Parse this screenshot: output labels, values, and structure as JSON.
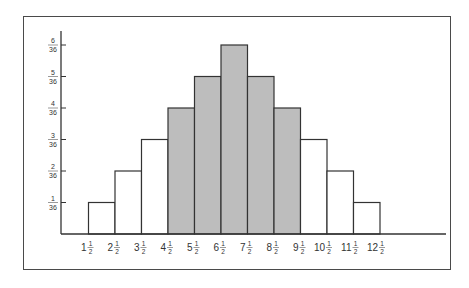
{
  "chart_data": {
    "type": "bar",
    "title": "",
    "xlabel": "",
    "ylabel": "",
    "categories": [
      "1 1/2",
      "2 1/2",
      "3 1/2",
      "4 1/2",
      "5 1/2",
      "6 1/2",
      "7 1/2",
      "8 1/2",
      "9 1/2",
      "10 1/2",
      "11 1/2",
      "12 1/2"
    ],
    "x_tick_labels": [
      {
        "whole": "1",
        "num": "1",
        "den": "2"
      },
      {
        "whole": "2",
        "num": "1",
        "den": "2"
      },
      {
        "whole": "3",
        "num": "1",
        "den": "2"
      },
      {
        "whole": "4",
        "num": "1",
        "den": "2"
      },
      {
        "whole": "5",
        "num": "1",
        "den": "2"
      },
      {
        "whole": "6",
        "num": "1",
        "den": "2"
      },
      {
        "whole": "7",
        "num": "1",
        "den": "2"
      },
      {
        "whole": "8",
        "num": "1",
        "den": "2"
      },
      {
        "whole": "9",
        "num": "1",
        "den": "2"
      },
      {
        "whole": "10",
        "num": "1",
        "den": "2"
      },
      {
        "whole": "11",
        "num": "1",
        "den": "2"
      },
      {
        "whole": "12",
        "num": "1",
        "den": "2"
      }
    ],
    "bar_bins": [
      {
        "left": "1 1/2",
        "right": "2 1/2",
        "value_numerator": 1,
        "shaded": false
      },
      {
        "left": "2 1/2",
        "right": "3 1/2",
        "value_numerator": 2,
        "shaded": false
      },
      {
        "left": "3 1/2",
        "right": "4 1/2",
        "value_numerator": 3,
        "shaded": false
      },
      {
        "left": "4 1/2",
        "right": "5 1/2",
        "value_numerator": 4,
        "shaded": true
      },
      {
        "left": "5 1/2",
        "right": "6 1/2",
        "value_numerator": 5,
        "shaded": true
      },
      {
        "left": "6 1/2",
        "right": "7 1/2",
        "value_numerator": 6,
        "shaded": true
      },
      {
        "left": "7 1/2",
        "right": "8 1/2",
        "value_numerator": 5,
        "shaded": true
      },
      {
        "left": "8 1/2",
        "right": "9 1/2",
        "value_numerator": 4,
        "shaded": true
      },
      {
        "left": "9 1/2",
        "right": "10 1/2",
        "value_numerator": 3,
        "shaded": false
      },
      {
        "left": "10 1/2",
        "right": "11 1/2",
        "value_numerator": 2,
        "shaded": false
      },
      {
        "left": "11 1/2",
        "right": "12 1/2",
        "value_numerator": 1,
        "shaded": false
      }
    ],
    "value_denominator": 36,
    "y_ticks": [
      {
        "num": "1",
        "den": "36",
        "value": 1
      },
      {
        "num": "2",
        "den": "36",
        "value": 2
      },
      {
        "num": "3",
        "den": "36",
        "value": 3
      },
      {
        "num": "4",
        "den": "36",
        "value": 4
      },
      {
        "num": "5",
        "den": "36",
        "value": 5
      },
      {
        "num": "6",
        "den": "36",
        "value": 6
      }
    ],
    "ylim_numerator": [
      0,
      6.4
    ],
    "grid": false,
    "legend": "none",
    "colors": {
      "shaded": "#bdbdbd",
      "unshaded": "#ffffff",
      "stroke": "#333333"
    }
  }
}
